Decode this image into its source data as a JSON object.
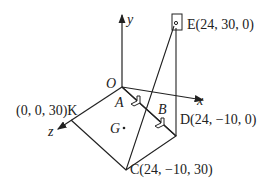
{
  "diagram": {
    "type": "3d-coordinate-geometry",
    "axes": {
      "x": "x",
      "y": "y",
      "z": "z",
      "origin": "O"
    },
    "points": {
      "E": {
        "label": "E(24, 30, 0)"
      },
      "D": {
        "label": "D(24, −10, 0)"
      },
      "C": {
        "label": "C(24, −10, 30)"
      },
      "K": {
        "label": "(0, 0, 30)K"
      },
      "A": {
        "label": "A"
      },
      "B": {
        "label": "B"
      },
      "G": {
        "label": "G"
      }
    },
    "colors": {
      "line": "#222222",
      "background": "#ffffff"
    }
  }
}
